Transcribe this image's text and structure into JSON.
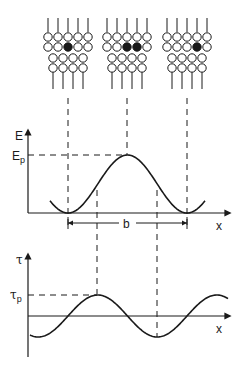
{
  "diagram": {
    "colors": {
      "ink": "#1a1a1a",
      "background": "#ffffff"
    },
    "lattice_panels": [
      {
        "name": "initial-position",
        "solute_atoms": 1
      },
      {
        "name": "saddle-point",
        "solute_atoms": 2
      },
      {
        "name": "next-position",
        "solute_atoms": 1
      }
    ],
    "energy_plot": {
      "y_label": "E",
      "peak_label": "E",
      "peak_subscript": "p",
      "x_label": "x",
      "period_label": "b"
    },
    "stress_plot": {
      "y_label": "τ",
      "peak_label": "τ",
      "peak_subscript": "p",
      "x_label": "x"
    }
  },
  "chart_data": [
    {
      "type": "line",
      "title": "Energy vs. dislocation position",
      "xlabel": "x",
      "ylabel": "E",
      "annotations": [
        "Ep (peak energy)",
        "b (lattice period)"
      ],
      "x": [
        0,
        0.25,
        0.5,
        0.75,
        1.0
      ],
      "values": [
        0,
        0.5,
        1.0,
        0.5,
        0
      ],
      "description": "E(x) = (Ep/2)(1 - cos(2πx/b)), minima at 0 and b, maximum Ep at b/2"
    },
    {
      "type": "line",
      "title": "Shear stress vs. dislocation position",
      "xlabel": "x",
      "ylabel": "τ",
      "annotations": [
        "τp (Peierls stress)"
      ],
      "x": [
        0,
        0.25,
        0.5,
        0.75,
        1.0
      ],
      "values": [
        0,
        1.0,
        0,
        -1.0,
        0
      ],
      "description": "τ(x) = τp sin(2πx/b), maximum τp at b/4, minimum -τp at 3b/4"
    }
  ]
}
